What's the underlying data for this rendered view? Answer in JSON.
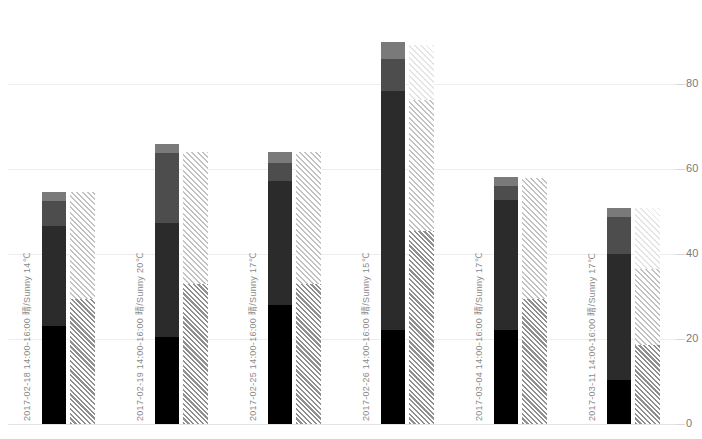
{
  "chart_data": {
    "type": "bar",
    "title": "",
    "subtitle": "",
    "xlabel": "",
    "ylabel": "",
    "ylim": [
      0,
      90
    ],
    "yticks": [
      0,
      20,
      40,
      60,
      80
    ],
    "ytick_labels": [
      "0",
      "20",
      "40",
      "60",
      "80"
    ],
    "grid": true,
    "legend": "none",
    "stacked": true,
    "grouped_pairs": true,
    "categories": [
      "2017-02-18  14:00-16:00  晴/Sunny  14℃",
      "2017-02-19  14:00-16:00  晴/Sunny  20℃",
      "2017-02-25  14:00-16:00  晴/Sunny  17℃",
      "2017-02-26  14:00-16:00  晴/Sunny  15℃",
      "2017-03-04  14:00-16:00  晴/Sunny  17℃",
      "2017-03-11  14:00-16:00  晴/Sunny  17℃"
    ],
    "category_meta": [
      {
        "date": "2017-02-18",
        "time": "14:00-16:00",
        "weather": "晴/Sunny",
        "temperature": "14℃"
      },
      {
        "date": "2017-02-19",
        "time": "14:00-16:00",
        "weather": "晴/Sunny",
        "temperature": "20℃"
      },
      {
        "date": "2017-02-25",
        "time": "14:00-16:00",
        "weather": "晴/Sunny",
        "temperature": "17℃"
      },
      {
        "date": "2017-02-26",
        "time": "14:00-16:00",
        "weather": "晴/Sunny",
        "temperature": "15℃"
      },
      {
        "date": "2017-03-04",
        "time": "14:00-16:00",
        "weather": "晴/Sunny",
        "temperature": "17℃"
      },
      {
        "date": "2017-03-11",
        "time": "14:00-16:00",
        "weather": "晴/Sunny",
        "temperature": "17℃"
      }
    ],
    "bars": [
      {
        "category_index": 0,
        "solid": {
          "total": 54.5,
          "segments": [
            23.0,
            23.5,
            5.9,
            2.1
          ]
        },
        "hatched": {
          "total": 54.5,
          "segments": [
            29.5,
            25.0
          ]
        }
      },
      {
        "category_index": 1,
        "solid": {
          "total": 66.0,
          "segments": [
            20.4,
            27.0,
            16.3,
            2.3
          ]
        },
        "hatched": {
          "total": 64.0,
          "segments": [
            33.0,
            31.0
          ]
        }
      },
      {
        "category_index": 2,
        "solid": {
          "total": 63.9,
          "segments": [
            27.9,
            29.3,
            4.2,
            2.5
          ]
        },
        "hatched": {
          "total": 63.9,
          "segments": [
            33.0,
            30.9
          ]
        }
      },
      {
        "category_index": 3,
        "solid": {
          "total": 89.9,
          "segments": [
            22.1,
            56.3,
            7.5,
            4.0
          ]
        },
        "hatched": {
          "total": 89.2,
          "segments": [
            45.5,
            30.7,
            13.0
          ]
        }
      },
      {
        "category_index": 4,
        "solid": {
          "total": 58.2,
          "segments": [
            22.1,
            30.5,
            3.3,
            2.3
          ]
        },
        "hatched": {
          "total": 57.8,
          "segments": [
            29.5,
            28.3
          ]
        }
      },
      {
        "category_index": 5,
        "solid": {
          "total": 50.9,
          "segments": [
            10.3,
            29.8,
            8.5,
            2.3
          ]
        },
        "hatched": {
          "total": 50.9,
          "segments": [
            18.5,
            18.0,
            14.4
          ]
        }
      }
    ],
    "palette": {
      "solid_segment_colors": [
        "#000000",
        "#2b2b2b",
        "#4d4d4d",
        "#7a7a7a"
      ],
      "hatch_segment_colors": [
        "#8f8f8f",
        "#c2c2c2",
        "#e4e4e4"
      ],
      "gridline_color": "#ededed",
      "axis_text_color": "#7a7a7a",
      "background": "#ffffff"
    }
  },
  "axis": {
    "y_ticks": [
      {
        "label": "80",
        "value": 80
      },
      {
        "label": "60",
        "value": 60
      },
      {
        "label": "40",
        "value": 40
      },
      {
        "label": "20",
        "value": 20
      },
      {
        "label": "0",
        "value": 0
      }
    ]
  }
}
